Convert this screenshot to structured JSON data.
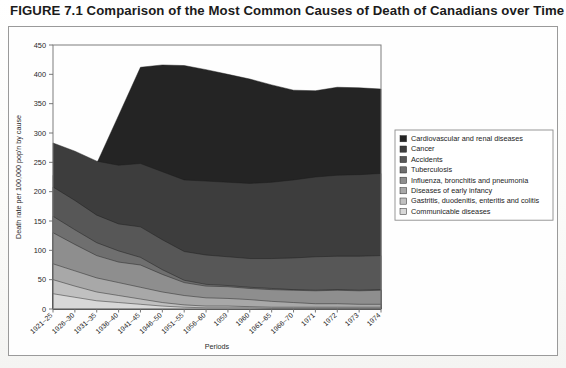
{
  "figure": {
    "title": "FIGURE 7.1 Comparison of the Most Common Causes of Death of Canadians over Time"
  },
  "chart_data": {
    "type": "area",
    "stacked": true,
    "title": "",
    "xlabel": "Periods",
    "ylabel": "Death rate per 100,000 pop'n by cause",
    "ylim": [
      0,
      450
    ],
    "ytick_step": 50,
    "yticks": [
      0,
      50,
      100,
      150,
      200,
      250,
      300,
      350,
      400,
      450
    ],
    "grid": false,
    "legend_position": "right",
    "categories": [
      "1921–25",
      "1926–30",
      "1931–35",
      "1936–40",
      "1941–45",
      "1946–50",
      "1951–55",
      "1956–60",
      "1959",
      "1960",
      "1961–65",
      "1966–70",
      "1971",
      "1972",
      "1973",
      "1974"
    ],
    "series": [
      {
        "name": "Communicable diseases",
        "color": "#d8d8d8",
        "values": [
          26,
          20,
          14,
          11,
          8,
          5,
          3,
          2,
          2,
          2,
          1,
          1,
          1,
          1,
          1,
          1
        ]
      },
      {
        "name": "Gastritis, duodenitis, enteritis and colitis",
        "color": "#c0c0c0",
        "values": [
          24,
          19,
          15,
          12,
          9,
          6,
          4,
          3,
          3,
          2,
          2,
          2,
          2,
          2,
          2,
          2
        ]
      },
      {
        "name": "Diseases of early infancy",
        "color": "#a8a8a8",
        "values": [
          27,
          26,
          24,
          22,
          20,
          18,
          16,
          14,
          13,
          12,
          10,
          8,
          6,
          6,
          5,
          5
        ]
      },
      {
        "name": "Influenza, bronchitis and pneumonia",
        "color": "#8e8e8e",
        "values": [
          53,
          45,
          38,
          35,
          38,
          30,
          22,
          20,
          20,
          19,
          20,
          21,
          22,
          23,
          23,
          24
        ]
      },
      {
        "name": "Tuberculosis",
        "color": "#6f6f6f",
        "values": [
          28,
          25,
          22,
          19,
          13,
          8,
          4,
          3,
          2,
          2,
          2,
          1,
          1,
          1,
          1,
          1
        ]
      },
      {
        "name": "Accidents",
        "color": "#575757",
        "values": [
          50,
          50,
          47,
          46,
          52,
          51,
          49,
          50,
          49,
          49,
          51,
          54,
          57,
          57,
          58,
          58
        ]
      },
      {
        "name": "Cancer",
        "color": "#3d3d3d",
        "values": [
          75,
          84,
          92,
          100,
          108,
          116,
          122,
          126,
          127,
          128,
          130,
          133,
          136,
          138,
          139,
          140
        ]
      },
      {
        "name": "Cardiovascular and renal diseases",
        "color": "#242424",
        "values": [
          0,
          0,
          0,
          0,
          0,
          0,
          0,
          0,
          0,
          0,
          0,
          0,
          0,
          0,
          0,
          0
        ]
      }
    ],
    "stack_tops": {
      "comment": "cumulative upper boundary of the stacked area, top band = Cardiovascular and renal diseases",
      "total": [
        228,
        236,
        248,
        330,
        412,
        416,
        415,
        408,
        400,
        392,
        382,
        373,
        372,
        378,
        377,
        375
      ]
    },
    "legend": [
      {
        "label": "Cardiovascular and renal diseases",
        "color": "#242424"
      },
      {
        "label": "Cancer",
        "color": "#3d3d3d"
      },
      {
        "label": "Accidents",
        "color": "#575757"
      },
      {
        "label": "Tuberculosis",
        "color": "#6f6f6f"
      },
      {
        "label": "Influenza, bronchitis and pneumonia",
        "color": "#8e8e8e"
      },
      {
        "label": "Diseases of early infancy",
        "color": "#a8a8a8"
      },
      {
        "label": "Gastritis, duodenitis, enteritis and colitis",
        "color": "#c0c0c0"
      },
      {
        "label": "Communicable diseases",
        "color": "#d8d8d8"
      }
    ]
  }
}
